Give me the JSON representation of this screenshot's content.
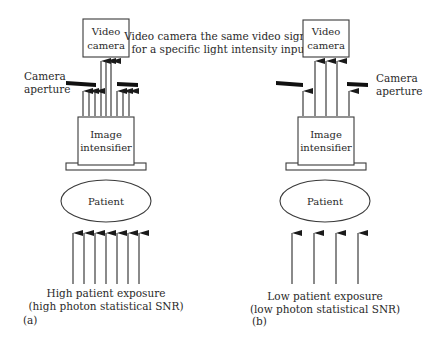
{
  "figure": {
    "center_note": {
      "line1": "Video camera the same video signal",
      "line2": "for a specific light intensity input"
    },
    "panels": [
      {
        "id": "a",
        "panel_label": "(a)",
        "video_camera": {
          "line1": "Video",
          "line2": "camera"
        },
        "aperture_label": {
          "line1": "Camera",
          "line2": "aperture"
        },
        "intensifier": {
          "line1": "Image",
          "line2": "intensifier"
        },
        "patient": "Patient",
        "exposure": {
          "line1": "High patient exposure",
          "line2": "(high photon statistical SNR)"
        },
        "incident_arrows": 7,
        "camera_arrows": 3,
        "blocked_arrows_each_side": 3
      },
      {
        "id": "b",
        "panel_label": "(b)",
        "video_camera": {
          "line1": "Video",
          "line2": "camera"
        },
        "aperture_label": {
          "line1": "Camera",
          "line2": "aperture"
        },
        "intensifier": {
          "line1": "Image",
          "line2": "intensifier"
        },
        "patient": "Patient",
        "exposure": {
          "line1": "Low patient exposure",
          "line2": "(low photon statistical SNR)"
        },
        "incident_arrows": 4,
        "camera_arrows": 3,
        "blocked_arrows_each_side": 1
      }
    ]
  }
}
